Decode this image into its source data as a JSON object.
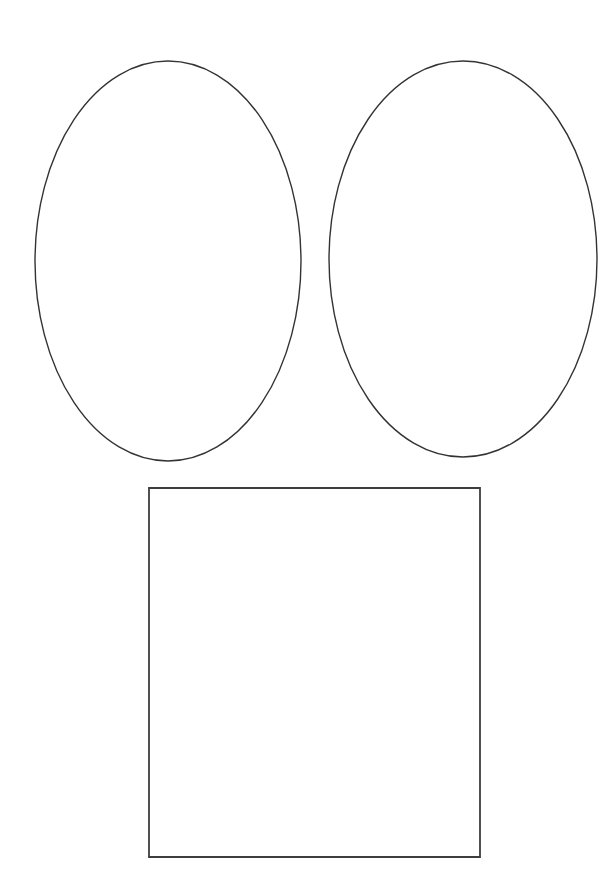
{
  "page": {
    "background_color": "#ffffff",
    "width": 606,
    "height": 896,
    "shape_count": 3
  },
  "style": {
    "stroke_color": "#333333",
    "rectangle_stroke_color": "#3d3d3d",
    "fill_color": "none",
    "ellipse_stroke_width": 1.4,
    "rectangle_stroke_width": 1.8
  },
  "shapes": [
    {
      "id": "ellipse-left",
      "name": "Left Ellipse",
      "type": "ellipse",
      "cx": 168,
      "cy": 261,
      "rx": 133,
      "ry": 200,
      "left": 35,
      "top": 61,
      "right": 301,
      "bottom": 461,
      "width": 266,
      "height": 400,
      "stroke": "#333333",
      "stroke_width": 1.4,
      "fill": "none"
    },
    {
      "id": "ellipse-right",
      "name": "Right Ellipse",
      "type": "ellipse",
      "cx": 463,
      "cy": 259,
      "rx": 134,
      "ry": 198,
      "left": 329,
      "top": 61,
      "right": 597,
      "bottom": 457,
      "width": 268,
      "height": 396,
      "stroke": "#333333",
      "stroke_width": 1.4,
      "fill": "none"
    },
    {
      "id": "rectangle-bottom",
      "name": "Bottom Rectangle",
      "type": "rectangle",
      "x": 149,
      "y": 488,
      "width": 331,
      "height": 369,
      "left": 149,
      "top": 488,
      "right": 480,
      "bottom": 857,
      "stroke": "#3d3d3d",
      "stroke_width": 1.8,
      "fill": "none"
    }
  ]
}
